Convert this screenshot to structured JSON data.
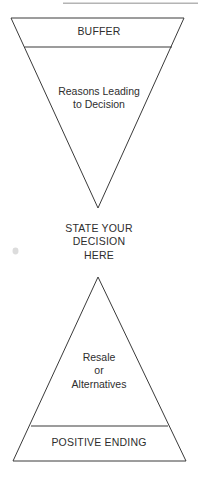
{
  "page": {
    "background_color": "#ffffff",
    "line_color": "#3a3a3a",
    "text_color": "#2e2e2e",
    "artifact_color": "#b4b4b4",
    "width": 198,
    "height": 487
  },
  "diagram": {
    "type": "funnel-hourglass",
    "sections": {
      "buffer": {
        "label": "BUFFER",
        "shape": "inverted-trapezoid-band"
      },
      "reasons": {
        "label": "Reasons Leading\nto Decision",
        "shape": "inverted-triangle"
      },
      "decision": {
        "label": "STATE YOUR\nDECISION\nHERE",
        "shape": "open-text"
      },
      "resale": {
        "label": "Resale\nor\nAlternatives",
        "shape": "upright-triangle"
      },
      "positive_ending": {
        "label": "POSITIVE ENDING",
        "shape": "upright-trapezoid-band"
      }
    }
  }
}
